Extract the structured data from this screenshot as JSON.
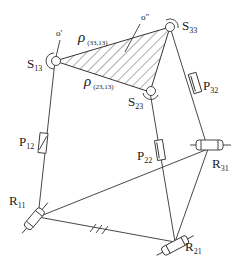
{
  "diagram": {
    "type": "parallel-mechanism-schematic",
    "platform": {
      "origin_label": "o\"",
      "edges": [
        {
          "symbol": "ρ",
          "subscript": "(33,13)"
        },
        {
          "symbol": "ρ",
          "subscript": "(23,13)"
        }
      ]
    },
    "frame_label": "o'",
    "joints": {
      "spherical": [
        {
          "id": "S13",
          "letter": "S",
          "sub": "13"
        },
        {
          "id": "S23",
          "letter": "S",
          "sub": "23"
        },
        {
          "id": "S33",
          "letter": "S",
          "sub": "33"
        }
      ],
      "prismatic": [
        {
          "id": "P12",
          "letter": "P",
          "sub": "12"
        },
        {
          "id": "P22",
          "letter": "P",
          "sub": "22"
        },
        {
          "id": "P32",
          "letter": "P",
          "sub": "32"
        }
      ],
      "revolute": [
        {
          "id": "R11",
          "letter": "R",
          "sub": "11"
        },
        {
          "id": "R21",
          "letter": "R",
          "sub": "21"
        },
        {
          "id": "R31",
          "letter": "R",
          "sub": "31"
        }
      ]
    },
    "legs": [
      {
        "from": "R11",
        "via": "P12",
        "to": "S13"
      },
      {
        "from": "R21",
        "via": "P22",
        "to": "S23"
      },
      {
        "from": "R31",
        "via": "P32",
        "to": "S33"
      }
    ],
    "base": {
      "triangle": [
        "R11",
        "R21",
        "R31"
      ],
      "ground_hatch": true
    }
  }
}
